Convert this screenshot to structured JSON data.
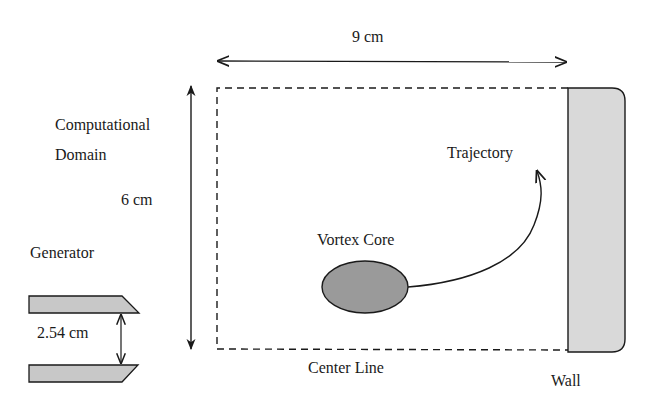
{
  "labels": {
    "width_dimension": "9 cm",
    "height_dimension": "6 cm",
    "domain_line1": "Computational",
    "domain_line2": "Domain",
    "generator": "Generator",
    "gap_dimension": "2.54 cm",
    "vortex_core": "Vortex Core",
    "trajectory": "Trajectory",
    "center_line": "Center Line",
    "wall": "Wall"
  },
  "colors": {
    "stroke": "#1a1a1a",
    "wall_fill": "#d9d9d9",
    "generator_fill": "#c8c8c8",
    "core_fill": "#9a9a9a"
  }
}
